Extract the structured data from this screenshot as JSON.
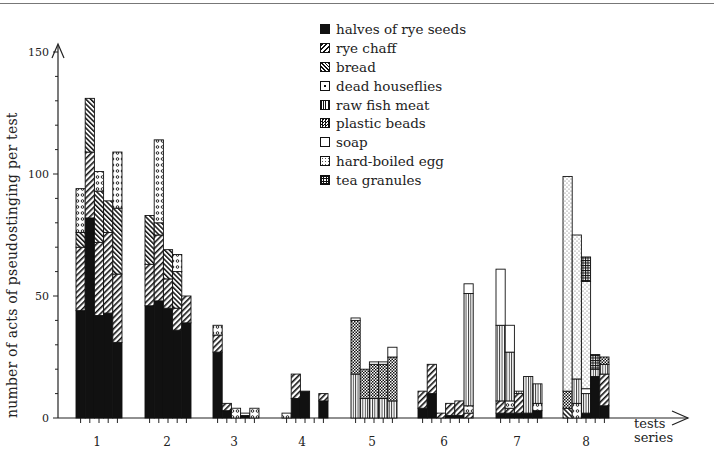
{
  "chart_data": {
    "type": "bar",
    "stacked": true,
    "title": "",
    "xlabel": "tests series",
    "ylabel": "number of acts of pseudostinging per test",
    "ylim": [
      0,
      150
    ],
    "yticks": [
      0,
      50,
      100,
      150
    ],
    "yminor_step": 10,
    "grid": false,
    "legend_position": "top-center",
    "categories": [
      "1",
      "2",
      "3",
      "4",
      "5",
      "6",
      "7",
      "8"
    ],
    "series_names": [
      "halves of rye seeds",
      "rye chaff",
      "bread",
      "dead houseflies",
      "raw fish meat",
      "plastic beads",
      "soap",
      "hard-boiled egg",
      "tea granules"
    ],
    "groups": [
      {
        "label": "1",
        "bars": [
          {
            "halves of rye seeds": 44,
            "rye chaff": 26,
            "bread": 6,
            "dead houseflies": 18
          },
          {
            "halves of rye seeds": 82,
            "rye chaff": 27,
            "bread": 22
          },
          {
            "halves of rye seeds": 42,
            "rye chaff": 30,
            "bread": 21,
            "dead houseflies": 8
          },
          {
            "halves of rye seeds": 43,
            "rye chaff": 33,
            "bread": 13
          },
          {
            "halves of rye seeds": 31,
            "rye chaff": 28,
            "bread": 27,
            "dead houseflies": 23
          }
        ]
      },
      {
        "label": "2",
        "bars": [
          {
            "halves of rye seeds": 46,
            "rye chaff": 17,
            "bread": 20
          },
          {
            "halves of rye seeds": 48,
            "rye chaff": 27,
            "bread": 5,
            "dead houseflies": 34
          },
          {
            "halves of rye seeds": 45,
            "rye chaff": 12,
            "bread": 12
          },
          {
            "halves of rye seeds": 36,
            "rye chaff": 9,
            "bread": 15,
            "dead houseflies": 7
          },
          {
            "halves of rye seeds": 39,
            "rye chaff": 11
          }
        ]
      },
      {
        "label": "3",
        "bars": [
          {
            "halves of rye seeds": 27,
            "rye chaff": 7,
            "dead houseflies": 4
          },
          {
            "halves of rye seeds": 3,
            "rye chaff": 3
          },
          {
            "dead houseflies": 4
          },
          {
            "halves of rye seeds": 1,
            "dead houseflies": 1
          },
          {
            "dead houseflies": 4
          }
        ]
      },
      {
        "label": "4",
        "bars": [
          {
            "dead houseflies": 2
          },
          {
            "halves of rye seeds": 8,
            "rye chaff": 10
          },
          {
            "halves of rye seeds": 11
          },
          {
            "halves of rye seeds": 0
          },
          {
            "halves of rye seeds": 7,
            "rye chaff": 3
          }
        ]
      },
      {
        "label": "5",
        "bars": [
          {
            "raw fish meat": 18,
            "plastic beads": 22,
            "soap": 1
          },
          {
            "raw fish meat": 8,
            "plastic beads": 12
          },
          {
            "raw fish meat": 8,
            "plastic beads": 14,
            "soap": 1
          },
          {
            "raw fish meat": 8,
            "plastic beads": 14,
            "soap": 1
          },
          {
            "raw fish meat": 7,
            "plastic beads": 18,
            "soap": 4
          }
        ]
      },
      {
        "label": "6",
        "bars": [
          {
            "halves of rye seeds": 4,
            "rye chaff": 7
          },
          {
            "halves of rye seeds": 10,
            "rye chaff": 12
          },
          {
            "rye chaff": 2
          },
          {
            "halves of rye seeds": 1,
            "rye chaff": 5
          },
          {
            "halves of rye seeds": 1,
            "rye chaff": 6
          },
          {
            "rye chaff": 2,
            "raw fish meat": 46,
            "dead houseflies": 3,
            "soap": 4
          }
        ]
      },
      {
        "label": "7",
        "bars": [
          {
            "halves of rye seeds": 2,
            "rye chaff": 5,
            "raw fish meat": 31,
            "soap": 23
          },
          {
            "halves of rye seeds": 2,
            "rye chaff": 2,
            "raw fish meat": 20,
            "dead houseflies": 3,
            "soap": 11
          },
          {
            "halves of rye seeds": 2,
            "rye chaff": 8,
            "raw fish meat": 1
          },
          {
            "halves of rye seeds": 2,
            "raw fish meat": 15
          },
          {
            "halves of rye seeds": 3,
            "dead houseflies": 3,
            "raw fish meat": 8
          }
        ]
      },
      {
        "label": "8",
        "bars": [
          {
            "bread": 4,
            "plastic beads": 7,
            "hard-boiled egg": 88
          },
          {
            "raw fish meat": 10,
            "dead houseflies": 6,
            "hard-boiled egg": 59
          },
          {
            "halves of rye seeds": 2,
            "raw fish meat": 8,
            "soap": 2,
            "hard-boiled egg": 44,
            "tea granules": 10
          },
          {
            "halves of rye seeds": 17,
            "raw fish meat": 3,
            "tea granules": 6
          },
          {
            "halves of rye seeds": 5,
            "rye chaff": 13,
            "raw fish meat": 4,
            "plastic beads": 3
          }
        ]
      }
    ]
  },
  "legend": {
    "items": [
      {
        "label": "halves of rye seeds",
        "pattern": "solid-black"
      },
      {
        "label": "rye chaff",
        "pattern": "diagonal-forward"
      },
      {
        "label": "bread",
        "pattern": "diagonal-back"
      },
      {
        "label": "dead houseflies",
        "pattern": "dots-circles"
      },
      {
        "label": "raw fish meat",
        "pattern": "vertical-lines"
      },
      {
        "label": "plastic beads",
        "pattern": "checker"
      },
      {
        "label": "soap",
        "pattern": "blank"
      },
      {
        "label": "hard-boiled egg",
        "pattern": "fine-dots"
      },
      {
        "label": "tea granules",
        "pattern": "grid"
      }
    ]
  },
  "axes": {
    "y_label": "number of acts of pseudostinging per test",
    "x_label_line1": "tests",
    "x_label_line2": "series",
    "y_tick_labels": [
      "0",
      "50",
      "100",
      "150"
    ],
    "x_tick_labels": [
      "1",
      "2",
      "3",
      "4",
      "5",
      "6",
      "7",
      "8"
    ]
  }
}
